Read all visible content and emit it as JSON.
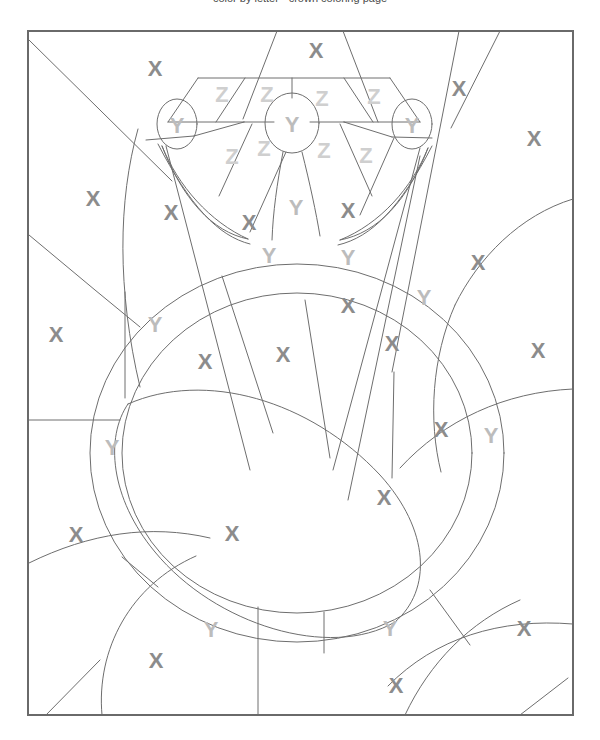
{
  "page": {
    "title_partial": "color by letter · crown coloring page",
    "background_color": "#ffffff",
    "width": 600,
    "height": 740
  },
  "artwork": {
    "name": "crown-color-by-letter",
    "frame": {
      "x": 28,
      "y": 31,
      "width": 545,
      "height": 684
    },
    "stroke_color": "#6e6e6e",
    "frame_stroke_color": "#6a6a6a",
    "stroke_width": 1,
    "frame_stroke_width": 2,
    "fill": "#ffffff"
  },
  "legend": {
    "letters": [
      "X",
      "Y",
      "Z"
    ],
    "colors": {
      "X": "#8c8c8c",
      "Y": "#bcbcbc",
      "Z": "#cfcfcf"
    }
  },
  "letters": [
    {
      "id": "x-1",
      "ch": "X",
      "x": 155,
      "y": 68,
      "size": 22
    },
    {
      "id": "x-2",
      "ch": "X",
      "x": 316,
      "y": 50,
      "size": 22
    },
    {
      "id": "x-3",
      "ch": "X",
      "x": 459,
      "y": 88,
      "size": 22
    },
    {
      "id": "x-4",
      "ch": "X",
      "x": 534,
      "y": 138,
      "size": 22
    },
    {
      "id": "x-5",
      "ch": "X",
      "x": 93,
      "y": 198,
      "size": 22
    },
    {
      "id": "x-6",
      "ch": "X",
      "x": 171,
      "y": 212,
      "size": 22
    },
    {
      "id": "x-7",
      "ch": "X",
      "x": 249,
      "y": 222,
      "size": 22
    },
    {
      "id": "x-8",
      "ch": "X",
      "x": 348,
      "y": 210,
      "size": 22
    },
    {
      "id": "x-9",
      "ch": "X",
      "x": 478,
      "y": 262,
      "size": 22
    },
    {
      "id": "x-10",
      "ch": "X",
      "x": 348,
      "y": 305,
      "size": 22
    },
    {
      "id": "x-11",
      "ch": "X",
      "x": 56,
      "y": 334,
      "size": 22
    },
    {
      "id": "x-12",
      "ch": "X",
      "x": 392,
      "y": 343,
      "size": 22
    },
    {
      "id": "x-13",
      "ch": "X",
      "x": 538,
      "y": 350,
      "size": 22
    },
    {
      "id": "x-14",
      "ch": "X",
      "x": 205,
      "y": 361,
      "size": 22
    },
    {
      "id": "x-15",
      "ch": "X",
      "x": 283,
      "y": 354,
      "size": 22
    },
    {
      "id": "x-16",
      "ch": "X",
      "x": 441,
      "y": 429,
      "size": 22
    },
    {
      "id": "x-17",
      "ch": "X",
      "x": 384,
      "y": 497,
      "size": 22
    },
    {
      "id": "x-18",
      "ch": "X",
      "x": 232,
      "y": 533,
      "size": 22
    },
    {
      "id": "x-19",
      "ch": "X",
      "x": 76,
      "y": 534,
      "size": 22
    },
    {
      "id": "x-20",
      "ch": "X",
      "x": 524,
      "y": 628,
      "size": 22
    },
    {
      "id": "x-21",
      "ch": "X",
      "x": 156,
      "y": 660,
      "size": 22
    },
    {
      "id": "x-22",
      "ch": "X",
      "x": 396,
      "y": 685,
      "size": 22
    },
    {
      "id": "y-1",
      "ch": "Y",
      "x": 177,
      "y": 125,
      "size": 22
    },
    {
      "id": "y-2",
      "ch": "Y",
      "x": 292,
      "y": 124,
      "size": 22
    },
    {
      "id": "y-3",
      "ch": "Y",
      "x": 412,
      "y": 125,
      "size": 22
    },
    {
      "id": "y-4",
      "ch": "Y",
      "x": 296,
      "y": 207,
      "size": 22
    },
    {
      "id": "y-5",
      "ch": "Y",
      "x": 269,
      "y": 255,
      "size": 22
    },
    {
      "id": "y-6",
      "ch": "Y",
      "x": 348,
      "y": 257,
      "size": 22
    },
    {
      "id": "y-7",
      "ch": "Y",
      "x": 155,
      "y": 324,
      "size": 22
    },
    {
      "id": "y-8",
      "ch": "Y",
      "x": 424,
      "y": 297,
      "size": 22
    },
    {
      "id": "y-9",
      "ch": "Y",
      "x": 112,
      "y": 447,
      "size": 22
    },
    {
      "id": "y-10",
      "ch": "Y",
      "x": 491,
      "y": 435,
      "size": 22
    },
    {
      "id": "y-11",
      "ch": "Y",
      "x": 211,
      "y": 629,
      "size": 22
    },
    {
      "id": "y-12",
      "ch": "Y",
      "x": 390,
      "y": 628,
      "size": 22
    },
    {
      "id": "z-1",
      "ch": "Z",
      "x": 222,
      "y": 94,
      "size": 22
    },
    {
      "id": "z-2",
      "ch": "Z",
      "x": 267,
      "y": 94,
      "size": 22
    },
    {
      "id": "z-3",
      "ch": "Z",
      "x": 322,
      "y": 98,
      "size": 22
    },
    {
      "id": "z-4",
      "ch": "Z",
      "x": 374,
      "y": 96,
      "size": 22
    },
    {
      "id": "z-5",
      "ch": "Z",
      "x": 232,
      "y": 156,
      "size": 22
    },
    {
      "id": "z-6",
      "ch": "Z",
      "x": 264,
      "y": 148,
      "size": 22
    },
    {
      "id": "z-7",
      "ch": "Z",
      "x": 324,
      "y": 150,
      "size": 22
    },
    {
      "id": "z-8",
      "ch": "Z",
      "x": 366,
      "y": 155,
      "size": 22
    }
  ],
  "shapes": {
    "outer_ring_note": "double concentric ring around central oval",
    "crown_jewel_count": 3
  }
}
